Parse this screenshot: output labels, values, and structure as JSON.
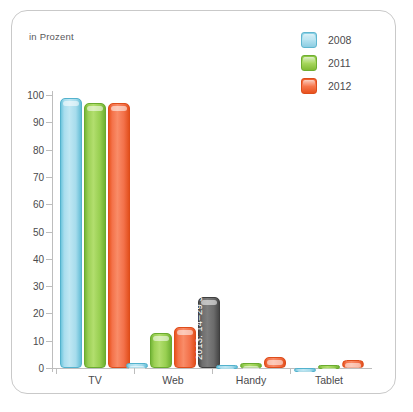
{
  "card": {
    "unit_label": "in Prozent",
    "bottom_caption": ""
  },
  "legend": {
    "position": "top-right",
    "items": [
      {
        "label": "2008",
        "color": "#a8ddee"
      },
      {
        "label": "2011",
        "color": "#9bd054"
      },
      {
        "label": "2012",
        "color": "#f4724a"
      }
    ]
  },
  "chart_data": {
    "type": "bar",
    "title": "",
    "subtitle": "",
    "xlabel": "",
    "ylabel": "in Prozent",
    "ylim": [
      0,
      100
    ],
    "yticks": [
      0,
      10,
      20,
      30,
      40,
      50,
      60,
      70,
      80,
      90,
      100
    ],
    "ytick_labels": [
      "0",
      "10",
      "20",
      "30",
      "40",
      "50",
      "60",
      "70",
      "80",
      "90",
      "100"
    ],
    "grid": false,
    "legend_position": "top-right",
    "categories": [
      "TV",
      "Web",
      "Handy",
      "Tablet"
    ],
    "series": [
      {
        "name": "2008",
        "color": "#a8ddee",
        "values": [
          99,
          2,
          1,
          0
        ]
      },
      {
        "name": "2011",
        "color": "#9bd054",
        "values": [
          97,
          13,
          2,
          1
        ]
      },
      {
        "name": "2012",
        "color": "#f4724a",
        "values": [
          97,
          15,
          4,
          3
        ]
      },
      {
        "name": "2013: 14–29 J",
        "color": "#6e6e6e",
        "values": [
          null,
          26,
          null,
          null
        ]
      }
    ],
    "annotations": [
      {
        "text": "2013: 14–29 J",
        "category": "Web",
        "series": "2013: 14–29 J",
        "value": 26,
        "orientation": "vertical",
        "color": "#ffffff"
      }
    ]
  }
}
